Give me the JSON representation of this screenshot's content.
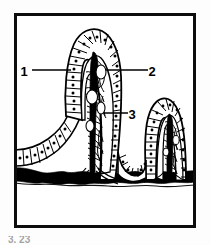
{
  "figure": {
    "background_color": "#fdfdfd",
    "ink_color": "#000000",
    "frame": {
      "name": "figure-border",
      "x": 14,
      "y": 13,
      "width": 182,
      "height": 215,
      "stroke_color": "#0d0d0d",
      "stroke_width": 3
    },
    "labels": [
      {
        "id": "label-1",
        "text": "1",
        "x": 24,
        "y": 71,
        "leader_from_x": 32,
        "leader_from_y": 70,
        "leader_to_x": 71,
        "leader_to_y": 70,
        "refers_to": "columnar epithelium of villus"
      },
      {
        "id": "label-2",
        "text": "2",
        "x": 152,
        "y": 71,
        "leader_from_x": 148,
        "leader_from_y": 70,
        "leader_to_x": 106,
        "leader_to_y": 70,
        "refers_to": "lamina propria core of villus"
      },
      {
        "id": "label-3",
        "text": "3",
        "x": 132,
        "y": 114,
        "leader_from_x": 128,
        "leader_from_y": 113,
        "leader_to_x": 104,
        "leader_to_y": 113,
        "refers_to": "central lacteal / capillary network"
      }
    ],
    "structures": [
      {
        "name": "tall-central-villus",
        "apex_x": 92,
        "apex_y": 30,
        "base_y": 178
      },
      {
        "name": "right-villus",
        "apex_x": 166,
        "apex_y": 95,
        "base_y": 178
      },
      {
        "name": "left-mucosal-slope",
        "from_x": 16,
        "from_y": 155,
        "to_x": 62,
        "to_y": 120
      },
      {
        "name": "muscularis-mucosae-band",
        "y": 176,
        "thickness": 10,
        "fill": "#000000"
      },
      {
        "name": "submucosa-area",
        "y": 186,
        "fill": "#ffffff"
      }
    ],
    "caption_fragment": "3. 23"
  }
}
